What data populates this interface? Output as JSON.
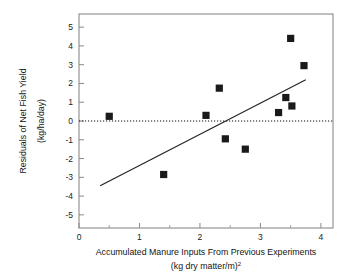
{
  "chart_data": {
    "type": "scatter",
    "title": "",
    "xlabel": "Accumulated Manure Inputs From Previous Experiments",
    "xlabel_units": "(kg dry matter/m²)",
    "ylabel": "Residuals of Net Fish Yield",
    "ylabel_units": "(kg/ha/day)",
    "xlim": [
      0,
      4.2
    ],
    "ylim": [
      -5.7,
      5.7
    ],
    "xticks": [
      0,
      1,
      2,
      3,
      4
    ],
    "xtick_labels": [
      "0",
      "1",
      "2",
      "3",
      "4"
    ],
    "x_minor_ticks": [
      0.5,
      1.5,
      2.5,
      3.5
    ],
    "yticks": [
      -5,
      -4,
      -3,
      -2,
      -1,
      0,
      1,
      2,
      3,
      4,
      5
    ],
    "ytick_labels": [
      "-5",
      "-4",
      "-3",
      "-2",
      "-1",
      "0",
      "1",
      "2",
      "3",
      "4",
      "5"
    ],
    "grid": false,
    "legend": "none",
    "marker": "filled-square",
    "marker_color": "#1a1a1a",
    "points": [
      {
        "x": 0.5,
        "y": 0.25
      },
      {
        "x": 1.4,
        "y": -2.85
      },
      {
        "x": 2.1,
        "y": 0.3
      },
      {
        "x": 2.32,
        "y": 1.75
      },
      {
        "x": 2.42,
        "y": -0.95
      },
      {
        "x": 2.75,
        "y": -1.5
      },
      {
        "x": 3.3,
        "y": 0.45
      },
      {
        "x": 3.42,
        "y": 1.25
      },
      {
        "x": 3.5,
        "y": 4.4
      },
      {
        "x": 3.52,
        "y": 0.8
      },
      {
        "x": 3.72,
        "y": 2.95
      }
    ],
    "regression_line": {
      "x_start": 0.35,
      "y_start": -3.45,
      "x_end": 3.75,
      "y_end": 2.2,
      "color": "#222222"
    },
    "zero_reference_line": {
      "y": 0,
      "style": "dotted",
      "color": "#111111"
    }
  },
  "figure": {
    "background": "#ffffff",
    "frame_color": "#7a7a7a"
  }
}
